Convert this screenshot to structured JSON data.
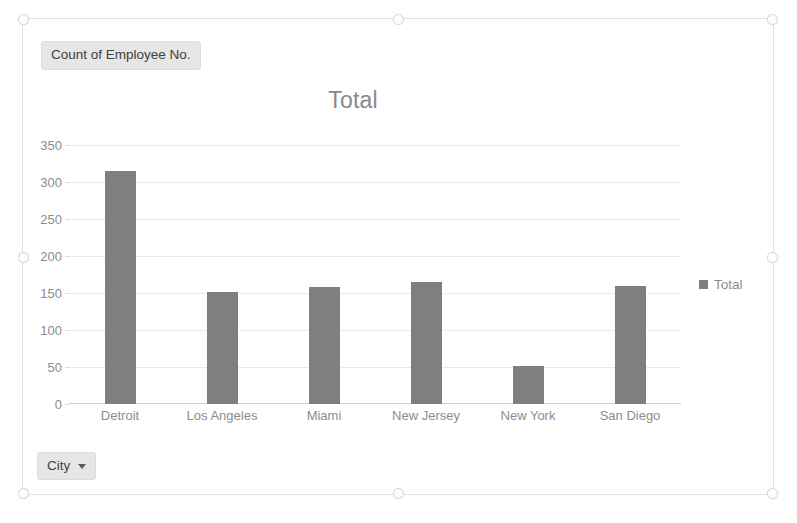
{
  "chart_object": {
    "field_button_values": {
      "label": "Count of Employee No."
    },
    "field_button_axis": {
      "label": "City",
      "caret_icon": "chevron-down-icon"
    }
  },
  "chart_data": {
    "type": "bar",
    "title": "Total",
    "xlabel": "",
    "ylabel": "",
    "categories": [
      "Detroit",
      "Los Angeles",
      "Miami",
      "New Jersey",
      "New York",
      "San Diego"
    ],
    "series": [
      {
        "name": "Total",
        "values": [
          315,
          151,
          158,
          165,
          52,
          160
        ],
        "color": "#7f7f7f"
      }
    ],
    "ylim": [
      0,
      350
    ],
    "yticks": [
      350,
      300,
      250,
      200,
      150,
      100,
      50,
      0
    ],
    "ytick_labels": [
      "350",
      "300",
      "250",
      "200",
      "150",
      "100",
      "50",
      "0"
    ],
    "grid": true,
    "legend": {
      "position": "right",
      "entries": [
        "Total"
      ]
    }
  }
}
